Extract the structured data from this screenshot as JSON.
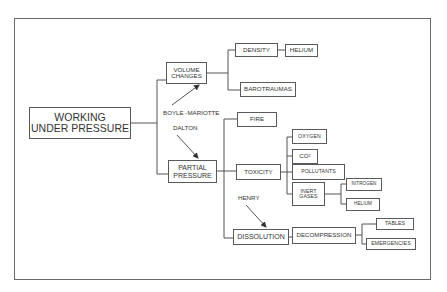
{
  "diagram": {
    "root": "WORKING\nUNDER PRESSURE",
    "nodes": {
      "volume_changes": "VOLUME\nCHANGES",
      "density": "DENSITY",
      "helium_density": "HELIUM",
      "barotraumas": "BAROTRAUMAS",
      "partial_pressure": "PARTIAL\nPRESSURE",
      "fire": "FIRE",
      "toxicity": "TOXICITY",
      "oxygen": "OXYGEN",
      "co2_base": "CO",
      "co2_sub": "2",
      "pollutants": "POLLUTANTS",
      "inert_gases": "INERT\nGASES",
      "nitrogen": "NITROGEN",
      "helium_inert": "HELIUM",
      "dissolution": "DISSOLUTION",
      "decompression": "DECOMPRESSION",
      "tables": "TABLES",
      "emergencies": "EMERGENCIES"
    },
    "laws": {
      "boyle_mariotte": "BOYLE -MARIOTTE",
      "dalton": "DALTON",
      "henry": "HENRY"
    },
    "edges": [
      [
        "WORKING UNDER PRESSURE",
        "VOLUME CHANGES"
      ],
      [
        "WORKING UNDER PRESSURE",
        "PARTIAL PRESSURE"
      ],
      [
        "VOLUME CHANGES",
        "DENSITY"
      ],
      [
        "DENSITY",
        "HELIUM"
      ],
      [
        "VOLUME CHANGES",
        "BAROTRAUMAS"
      ],
      [
        "PARTIAL PRESSURE",
        "FIRE"
      ],
      [
        "PARTIAL PRESSURE",
        "TOXICITY"
      ],
      [
        "PARTIAL PRESSURE",
        "DISSOLUTION"
      ],
      [
        "TOXICITY",
        "OXYGEN"
      ],
      [
        "TOXICITY",
        "CO2"
      ],
      [
        "TOXICITY",
        "POLLUTANTS"
      ],
      [
        "TOXICITY",
        "INERT GASES"
      ],
      [
        "INERT GASES",
        "NITROGEN"
      ],
      [
        "INERT GASES",
        "HELIUM"
      ],
      [
        "DISSOLUTION",
        "DECOMPRESSION"
      ],
      [
        "DECOMPRESSION",
        "TABLES"
      ],
      [
        "DECOMPRESSION",
        "EMERGENCIES"
      ]
    ],
    "law_arrows": [
      [
        "BOYLE -MARIOTTE",
        "VOLUME CHANGES"
      ],
      [
        "DALTON",
        "PARTIAL PRESSURE"
      ],
      [
        "HENRY",
        "DISSOLUTION"
      ]
    ]
  }
}
